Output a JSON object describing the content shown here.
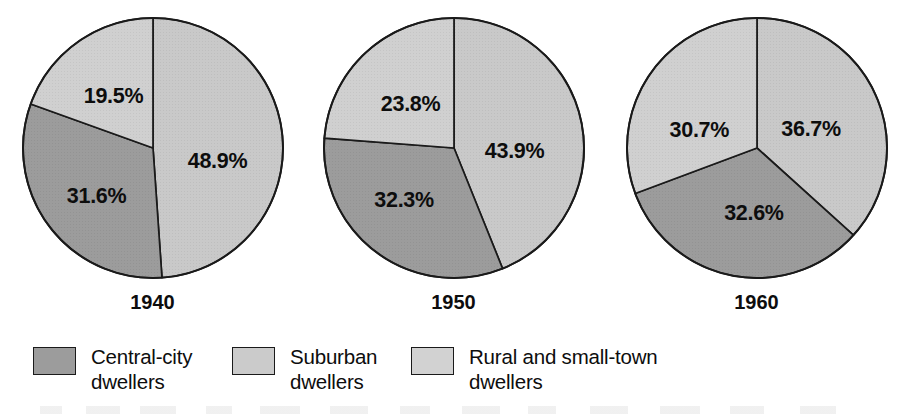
{
  "chart_data": {
    "type": "pie",
    "title": "",
    "subtitle": "",
    "xlabel": "",
    "ylabel": "",
    "legend_position": "bottom",
    "grid": false,
    "categories": [
      "Suburban dwellers",
      "Central-city dwellers",
      "Rural and small-town dwellers"
    ],
    "charts": [
      {
        "label": "1940",
        "slices": [
          {
            "category": "Suburban dwellers",
            "value": 48.9,
            "label": "48.9%",
            "color": "#c9c9c9"
          },
          {
            "category": "Central-city dwellers",
            "value": 31.6,
            "label": "31.6%",
            "color": "#9c9c9c"
          },
          {
            "category": "Rural and small-town dwellers",
            "value": 19.5,
            "label": "19.5%",
            "color": "#d0d0d0"
          }
        ]
      },
      {
        "label": "1950",
        "slices": [
          {
            "category": "Suburban dwellers",
            "value": 43.9,
            "label": "43.9%",
            "color": "#c9c9c9"
          },
          {
            "category": "Central-city dwellers",
            "value": 32.3,
            "label": "32.3%",
            "color": "#9c9c9c"
          },
          {
            "category": "Rural and small-town dwellers",
            "value": 23.8,
            "label": "23.8%",
            "color": "#d0d0d0"
          }
        ]
      },
      {
        "label": "1960",
        "slices": [
          {
            "category": "Suburban dwellers",
            "value": 36.7,
            "label": "36.7%",
            "color": "#c9c9c9"
          },
          {
            "category": "Central-city dwellers",
            "value": 32.6,
            "label": "32.6%",
            "color": "#9c9c9c"
          },
          {
            "category": "Rural and small-town dwellers",
            "value": 30.7,
            "label": "30.7%",
            "color": "#d0d0d0"
          }
        ]
      }
    ]
  },
  "pies": [
    {
      "year": "1940",
      "values": [
        48.9,
        31.6,
        19.5
      ],
      "labels": [
        "48.9%",
        "31.6%",
        "19.5%"
      ],
      "label_positions": [
        [
          0.5,
          0.1
        ],
        [
          -0.43,
          0.37
        ],
        [
          -0.3,
          -0.4
        ]
      ]
    },
    {
      "year": "1950",
      "values": [
        43.9,
        32.3,
        23.8
      ],
      "labels": [
        "43.9%",
        "32.3%",
        "23.8%"
      ],
      "label_positions": [
        [
          0.47,
          0.02
        ],
        [
          -0.38,
          0.4
        ],
        [
          -0.33,
          -0.34
        ]
      ]
    },
    {
      "year": "1960",
      "values": [
        36.7,
        32.6,
        30.7
      ],
      "labels": [
        "36.7%",
        "32.6%",
        "30.7%"
      ],
      "label_positions": [
        [
          0.42,
          -0.15
        ],
        [
          -0.02,
          0.5
        ],
        [
          -0.44,
          -0.14
        ]
      ]
    }
  ],
  "legend": {
    "items": [
      {
        "line1": "Central-city",
        "line2": "dwellers",
        "color": "#9c9c9c"
      },
      {
        "line1": "Suburban",
        "line2": "dwellers",
        "color": "#cbcbcb"
      },
      {
        "line1": "Rural and small-town",
        "line2": "dwellers",
        "color": "#d2d2d2"
      }
    ]
  },
  "colors": {
    "central_city": "#9c9c9c",
    "suburban": "#c9c9c9",
    "rural": "#d0d0d0",
    "outline": "#1a1a1a",
    "text": "#0d0d0d",
    "background": "#ffffff"
  }
}
